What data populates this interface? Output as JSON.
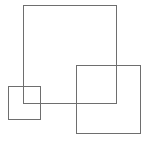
{
  "diagram": {
    "background": "#ffffff",
    "stroke_color": "#6e6e6e",
    "shapes": [
      {
        "name": "large-square",
        "type": "rect",
        "x": 23,
        "y": 5,
        "width": 94,
        "height": 99
      },
      {
        "name": "small-square",
        "type": "rect",
        "x": 8,
        "y": 86,
        "width": 33,
        "height": 34
      },
      {
        "name": "medium-square",
        "type": "rect",
        "x": 76,
        "y": 65,
        "width": 65,
        "height": 69
      }
    ]
  }
}
